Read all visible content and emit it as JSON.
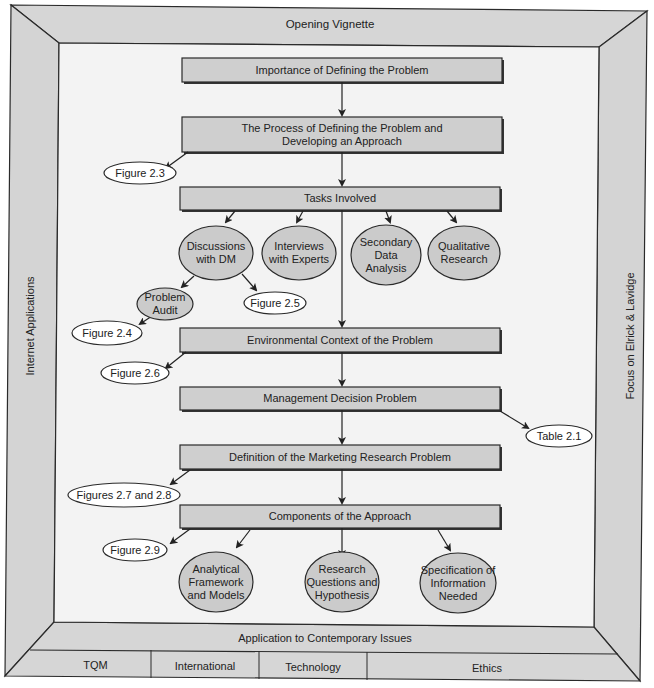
{
  "frame": {
    "top": "Opening Vignette",
    "left": "Internet Applications",
    "right": "Focus on Elrick & Lavidge",
    "bottom": "Application to Contemporary Issues",
    "bottom_tabs": [
      "TQM",
      "International",
      "Technology",
      "Ethics"
    ],
    "colors": {
      "frame_fill": "#d6d6d6",
      "box_fill": "#cfcfcf",
      "oval_fill": "#cbcbcb",
      "ref_fill": "#ffffff",
      "stroke": "#2a2a2a"
    }
  },
  "boxes": [
    {
      "id": "importance",
      "label": "Importance of Defining the Problem"
    },
    {
      "id": "process",
      "label": "The Process of Defining the Problem and\nDeveloping an Approach"
    },
    {
      "id": "tasks",
      "label": "Tasks Involved"
    },
    {
      "id": "environmental",
      "label": "Environmental Context of the Problem"
    },
    {
      "id": "management",
      "label": "Management Decision Problem"
    },
    {
      "id": "definition",
      "label": "Definition of the Marketing Research Problem"
    },
    {
      "id": "components",
      "label": "Components of the Approach"
    }
  ],
  "task_ovals": [
    {
      "id": "discussions",
      "label": "Discussions\nwith DM"
    },
    {
      "id": "interviews",
      "label": "Interviews\nwith Experts"
    },
    {
      "id": "secondary",
      "label": "Secondary\nData\nAnalysis"
    },
    {
      "id": "qualitative",
      "label": "Qualitative\nResearch"
    },
    {
      "id": "audit",
      "label": "Problem\nAudit"
    }
  ],
  "approach_ovals": [
    {
      "id": "analytical",
      "label": "Analytical\nFramework\nand Models"
    },
    {
      "id": "questions",
      "label": "Research\nQuestions and\nHypothesis"
    },
    {
      "id": "specification",
      "label": "Specification of\nInformation\nNeeded"
    }
  ],
  "references": [
    {
      "id": "fig23",
      "label": "Figure 2.3"
    },
    {
      "id": "fig25",
      "label": "Figure 2.5"
    },
    {
      "id": "fig24",
      "label": "Figure 2.4"
    },
    {
      "id": "fig26",
      "label": "Figure 2.6"
    },
    {
      "id": "tab21",
      "label": "Table 2.1"
    },
    {
      "id": "fig2728",
      "label": "Figures 2.7 and 2.8"
    },
    {
      "id": "fig29",
      "label": "Figure 2.9"
    }
  ]
}
